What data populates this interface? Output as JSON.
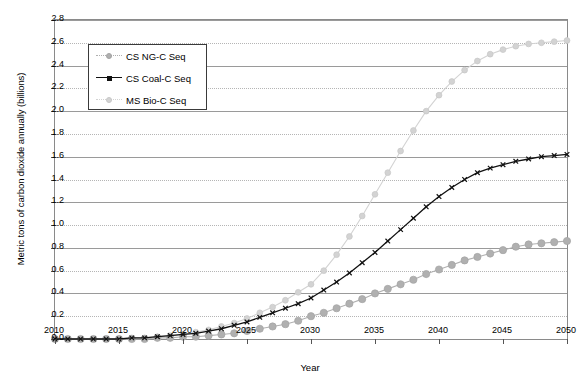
{
  "chart_data": {
    "type": "line",
    "title": "",
    "xlabel": "Year",
    "ylabel": "Metric tons of carbon dioxide annually (billions)",
    "xlim": [
      2010,
      2050
    ],
    "ylim": [
      0.0,
      2.8
    ],
    "yticks": [
      "0.0",
      "0.2",
      "0.4",
      "0.6",
      "0.8",
      "1.0",
      "1.2",
      "1.4",
      "1.6",
      "1.8",
      "2.0",
      "2.2",
      "2.4",
      "2.6",
      "2.8"
    ],
    "xticks": [
      "2010",
      "2015",
      "2020",
      "2025",
      "2030",
      "2035",
      "2040",
      "2045",
      "2050"
    ],
    "grid": true,
    "legend_position": "upper-left",
    "x": [
      2010,
      2011,
      2012,
      2013,
      2014,
      2015,
      2016,
      2017,
      2018,
      2019,
      2020,
      2021,
      2022,
      2023,
      2024,
      2025,
      2026,
      2027,
      2028,
      2029,
      2030,
      2031,
      2032,
      2033,
      2034,
      2035,
      2036,
      2037,
      2038,
      2039,
      2040,
      2041,
      2042,
      2043,
      2044,
      2045,
      2046,
      2047,
      2048,
      2049,
      2050
    ],
    "series": [
      {
        "name": "CS NG-C Seq",
        "color": "#b0b0b0",
        "marker": "circle",
        "values": [
          0.0,
          0.0,
          0.0,
          0.0,
          0.0,
          0.0,
          0.0,
          0.0,
          0.01,
          0.01,
          0.02,
          0.02,
          0.03,
          0.04,
          0.05,
          0.07,
          0.09,
          0.11,
          0.13,
          0.16,
          0.2,
          0.23,
          0.27,
          0.31,
          0.35,
          0.4,
          0.44,
          0.48,
          0.52,
          0.57,
          0.61,
          0.65,
          0.69,
          0.72,
          0.75,
          0.78,
          0.81,
          0.83,
          0.84,
          0.85,
          0.86
        ]
      },
      {
        "name": "CS Coal-C Seq",
        "color": "#111111",
        "marker": "x-square",
        "values": [
          0.0,
          0.0,
          0.0,
          0.0,
          0.0,
          0.0,
          0.01,
          0.01,
          0.02,
          0.03,
          0.04,
          0.05,
          0.07,
          0.09,
          0.12,
          0.15,
          0.19,
          0.23,
          0.27,
          0.31,
          0.36,
          0.43,
          0.5,
          0.58,
          0.67,
          0.76,
          0.86,
          0.96,
          1.06,
          1.16,
          1.25,
          1.33,
          1.4,
          1.46,
          1.5,
          1.53,
          1.56,
          1.58,
          1.6,
          1.61,
          1.62
        ]
      },
      {
        "name": "MS Bio-C Seq",
        "color": "#d3d3d3",
        "marker": "circle",
        "values": [
          0.0,
          0.0,
          0.0,
          0.0,
          0.0,
          0.0,
          0.01,
          0.01,
          0.02,
          0.03,
          0.04,
          0.06,
          0.08,
          0.11,
          0.14,
          0.18,
          0.23,
          0.28,
          0.34,
          0.41,
          0.48,
          0.6,
          0.74,
          0.9,
          1.08,
          1.27,
          1.46,
          1.65,
          1.83,
          2.0,
          2.14,
          2.26,
          2.36,
          2.44,
          2.5,
          2.54,
          2.57,
          2.59,
          2.6,
          2.61,
          2.62
        ]
      }
    ]
  },
  "legend": {
    "items": [
      {
        "label": "CS NG-C Seq"
      },
      {
        "label": "CS Coal-C Seq"
      },
      {
        "label": "MS Bio-C Seq"
      }
    ]
  }
}
